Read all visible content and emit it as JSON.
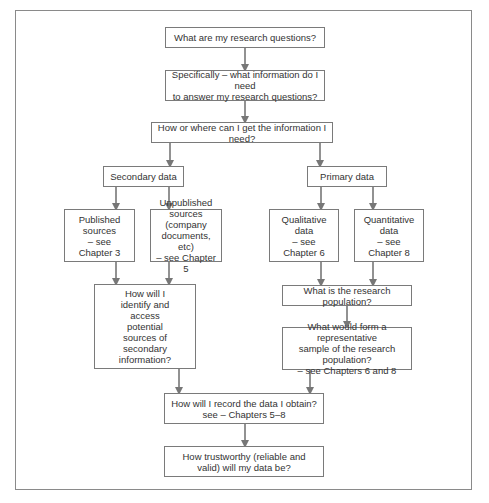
{
  "diagram": {
    "type": "flowchart",
    "colors": {
      "box_border": "#7a7a7a",
      "arrow": "#777777",
      "frame_border": "#8a8a8a",
      "text": "#333333"
    },
    "nodes": {
      "research_questions": "What are my research questions?",
      "information_needed": "Specifically – what information do I need\nto answer my research questions?",
      "how_where": "How or where can I get the information I need?",
      "secondary_data": "Secondary data",
      "primary_data": "Primary data",
      "published_sources": "Published\nsources\n– see\nChapter 3",
      "unpublished_sources": "Unpublished\nsources (company\ndocuments, etc)\n– see Chapter 5",
      "qualitative_data": "Qualitative\ndata\n– see\nChapter 6",
      "quantitative_data": "Quantitative\ndata\n– see\nChapter 8",
      "identify_access": "How will I\nidentify and\naccess\npotential\nsources of\nsecondary\ninformation?",
      "research_population": "What is the research population?",
      "representative_sample": "What would form a representative\nsample of the research population?\n– see Chapters 6 and 8",
      "record_data": "How will I record the data I obtain?\nsee – Chapters 5–8",
      "trustworthy": "How trustworthy (reliable and\nvalid) will my data be?"
    },
    "edges": [
      [
        "research_questions",
        "information_needed"
      ],
      [
        "information_needed",
        "how_where"
      ],
      [
        "how_where",
        "secondary_data"
      ],
      [
        "how_where",
        "primary_data"
      ],
      [
        "secondary_data",
        "published_sources"
      ],
      [
        "secondary_data",
        "unpublished_sources"
      ],
      [
        "primary_data",
        "qualitative_data"
      ],
      [
        "primary_data",
        "quantitative_data"
      ],
      [
        "published_sources",
        "identify_access"
      ],
      [
        "unpublished_sources",
        "identify_access"
      ],
      [
        "qualitative_data",
        "research_population"
      ],
      [
        "quantitative_data",
        "research_population"
      ],
      [
        "research_population",
        "representative_sample"
      ],
      [
        "identify_access",
        "record_data"
      ],
      [
        "representative_sample",
        "record_data"
      ],
      [
        "record_data",
        "trustworthy"
      ]
    ]
  }
}
